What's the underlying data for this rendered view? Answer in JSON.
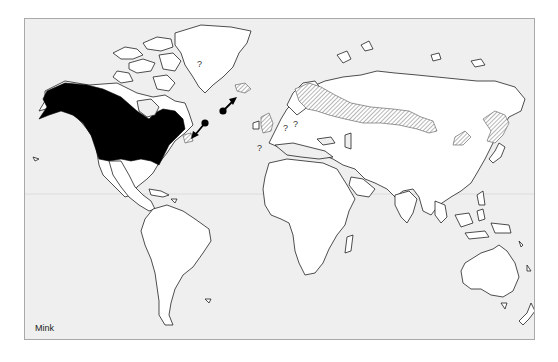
{
  "figure": {
    "caption": "Mink",
    "colors": {
      "background": "#efefef",
      "land": "#ffffff",
      "native_range": "#000000",
      "introduced_range_hatch": "#7a7a7a",
      "frame_border": "#a9a9a9"
    },
    "legend": {
      "native_range": "solid black fill (North America)",
      "introduced_range": "diagonal hatch (Europe, Asia, Iceland, Newfoundland)",
      "uncertain": "?"
    },
    "annotations": {
      "question_marks": [
        "?",
        "?",
        "?",
        "?"
      ],
      "arrows": 2
    }
  }
}
